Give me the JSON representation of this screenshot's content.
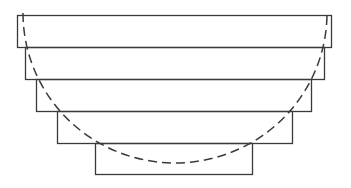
{
  "diagram": {
    "stroke_color": "#3a3a3a",
    "background": "#ffffff",
    "rectangles": [
      {
        "x": 17,
        "y": 15,
        "width": 314,
        "height": 32
      },
      {
        "x": 25,
        "y": 47,
        "width": 299,
        "height": 32
      },
      {
        "x": 36,
        "y": 79,
        "width": 275,
        "height": 32
      },
      {
        "x": 57,
        "y": 111,
        "width": 235,
        "height": 32
      },
      {
        "x": 95,
        "y": 143,
        "width": 157,
        "height": 31
      }
    ],
    "arc": {
      "style": "dashed",
      "center_x": 175,
      "top_y": 13,
      "radius_x": 152,
      "radius_y": 150,
      "dash": "9 5"
    }
  }
}
